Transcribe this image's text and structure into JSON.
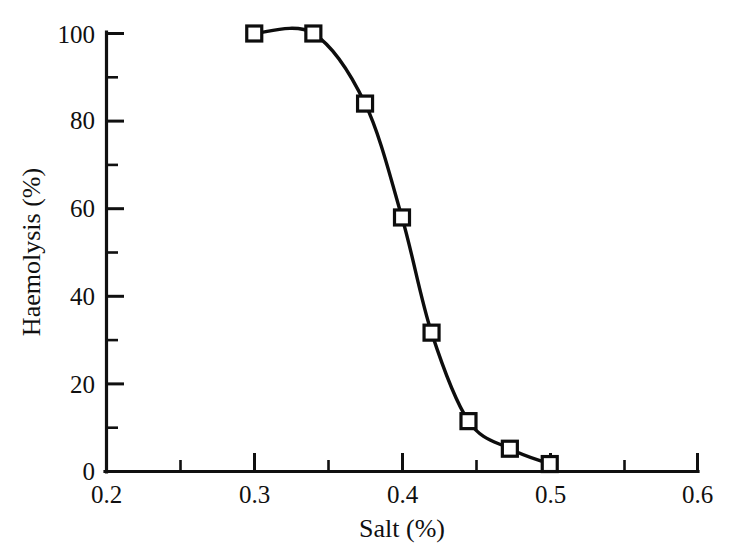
{
  "chart_data": {
    "type": "line",
    "title": "",
    "subtitle": "",
    "xlabel": "Salt (%)",
    "ylabel": "Haemolysis (%)",
    "xlim": [
      0.2,
      0.6
    ],
    "ylim": [
      0,
      100
    ],
    "grid": false,
    "legend": "none",
    "x_major_ticks": [
      0.2,
      0.3,
      0.4,
      0.5,
      0.6
    ],
    "x_major_tick_labels": [
      "0.2",
      "0.3",
      "0.4",
      "0.5",
      "0.6"
    ],
    "x_minor_ticks": [
      0.25,
      0.35,
      0.45,
      0.55
    ],
    "y_major_ticks": [
      0,
      20,
      40,
      60,
      80,
      100
    ],
    "y_major_tick_labels": [
      "0",
      "20",
      "40",
      "60",
      "80",
      "100"
    ],
    "y_minor_ticks": [
      10,
      30,
      50,
      70,
      90
    ],
    "series": [
      {
        "name": "haemolysis-curve",
        "marker": "open-square",
        "color": "#0d0d0d",
        "x": [
          0.3,
          0.34,
          0.375,
          0.4,
          0.42,
          0.445,
          0.473,
          0.5
        ],
        "y": [
          100,
          100,
          84,
          58,
          31.7,
          11.5,
          5.2,
          1.7
        ]
      }
    ]
  },
  "axes": {
    "x_axis_name": "Salt (%)",
    "y_axis_name": "Haemolysis (%)"
  }
}
